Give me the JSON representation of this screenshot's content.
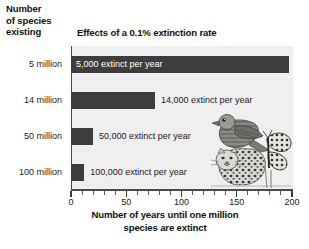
{
  "figure": {
    "y_axis_title": "Number\nof species\nexisting",
    "y_axis_title_lines": [
      "Number",
      "of species",
      "existing"
    ],
    "chart_title": "Effects of a 0.1% extinction rate",
    "x_axis_title_lines": [
      "Number of years until one million",
      "species are extinct"
    ],
    "illustration": "wildlife-illustration-falcon-leopard-butterfly"
  },
  "chart_data": {
    "type": "bar",
    "orientation": "horizontal",
    "title": "Effects of a 0.1% extinction rate",
    "xlabel": "Number of years until one million species are extinct",
    "ylabel": "Number of species existing",
    "categories": [
      "5 million",
      "14 million",
      "50 million",
      "100 million"
    ],
    "values": [
      197,
      76,
      20,
      12
    ],
    "data_labels": [
      "5,000 extinct per year",
      "14,000 extinct per year",
      "50,000 extinct per year",
      "100,000 extinct per year"
    ],
    "label_placement": [
      "inside",
      "outside",
      "outside",
      "outside"
    ],
    "xlim": [
      0,
      200
    ],
    "xticks": [
      0,
      50,
      100,
      150,
      200
    ],
    "xtick_labels": [
      "0",
      "50",
      "100",
      "150",
      "200"
    ],
    "minor_tick_interval": 10,
    "grid": false,
    "legend": "none",
    "bar_color": "#3d3d3d",
    "plot_background": "#efefef"
  }
}
